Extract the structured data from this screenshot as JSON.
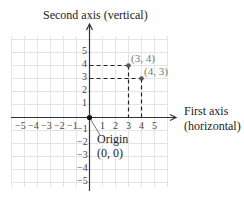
{
  "diagram": {
    "y_axis_label": "Second axis (vertical)",
    "x_axis_label_line1": "First axis",
    "x_axis_label_line2": "(horizontal)",
    "origin_label_line1": "Origin",
    "origin_label_line2": "(0, 0)",
    "x_ticks": [
      "−5",
      "−4",
      "−3",
      "−2",
      "−1",
      "1",
      "2",
      "3",
      "4",
      "5"
    ],
    "x_tick_values": [
      -5,
      -4,
      -3,
      -2,
      -1,
      1,
      2,
      3,
      4,
      5
    ],
    "y_ticks": [
      "5",
      "4",
      "3",
      "2",
      "1",
      "−1",
      "−2",
      "−3",
      "−4",
      "−5"
    ],
    "y_tick_values": [
      5,
      4,
      3,
      2,
      1,
      -1,
      -2,
      -3,
      -4,
      -5
    ],
    "points": [
      {
        "label": "(3, 4)",
        "x": 3,
        "y": 4
      },
      {
        "label": "(4, 3)",
        "x": 4,
        "y": 3
      }
    ],
    "colors": {
      "grid": "#e4e4e4",
      "axis": "#333333",
      "point": "#555555",
      "point_label": "#777777",
      "text": "#222222"
    }
  }
}
